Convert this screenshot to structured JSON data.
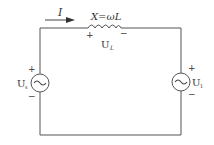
{
  "diagram": {
    "type": "ac-circuit",
    "current": {
      "symbol": "I",
      "direction": "left-to-right"
    },
    "inductor": {
      "reactance_label": "X=ωL",
      "voltage_label": "U",
      "voltage_subscript": "L",
      "plus": "+",
      "minus": "−"
    },
    "source_left": {
      "label": "U",
      "subscript": "s",
      "plus": "+",
      "minus": "−",
      "glyph": "~"
    },
    "source_right": {
      "label": "U",
      "subscript": "1",
      "plus": "+",
      "minus": "−",
      "glyph": "~"
    },
    "colors": {
      "wire": "#555555",
      "text": "#333333",
      "background": "#ffffff"
    }
  }
}
